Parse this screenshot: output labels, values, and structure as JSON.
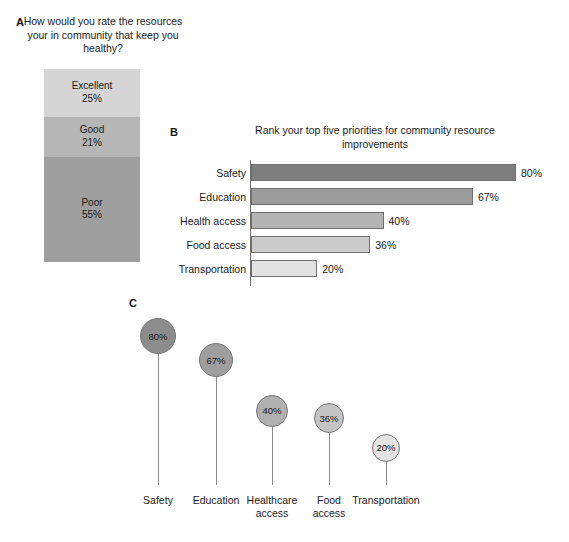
{
  "figure": {
    "width": 569,
    "height": 542,
    "background": "#ffffff"
  },
  "panel_a": {
    "letter": "A",
    "title": "How would you rate the resources your in community that keep you healthy?",
    "chart_data": {
      "type": "bar",
      "subtype": "stacked-100",
      "title": "How would you rate the resources your in community that keep you healthy?",
      "xlabel": "",
      "ylabel": "",
      "ylim": [
        0,
        100
      ],
      "grid": false,
      "legend": "none",
      "categories": [
        "Excellent",
        "Good",
        "Poor"
      ],
      "values": [
        25,
        21,
        55
      ],
      "value_labels": [
        "25%",
        "21%",
        "55%"
      ],
      "colors": [
        "#d5d5d5",
        "#b6b6b6",
        "#9e9e9e"
      ],
      "segments": [
        {
          "label": "Excellent",
          "value": 25,
          "value_label": "25%",
          "color": "#d5d5d5"
        },
        {
          "label": "Good",
          "value": 21,
          "value_label": "21%",
          "color": "#b6b6b6"
        },
        {
          "label": "Poor",
          "value": 55,
          "value_label": "55%",
          "color": "#9e9e9e"
        }
      ]
    }
  },
  "panel_b": {
    "letter": "B",
    "title": "Rank your top five priorities for community resource improvements",
    "chart_data": {
      "type": "bar",
      "subtype": "horizontal",
      "title": "Rank your top five priorities for community resource improvements",
      "xlabel": "",
      "ylabel": "",
      "xlim": [
        0,
        88
      ],
      "grid": false,
      "legend": "none",
      "categories": [
        "Safety",
        "Education",
        "Health access",
        "Food access",
        "Transportation"
      ],
      "values": [
        80,
        67,
        40,
        36,
        20
      ],
      "value_labels": [
        "80%",
        "67%",
        "40%",
        "36%",
        "20%"
      ],
      "colors": [
        "#7e7e7e",
        "#9c9c9c",
        "#b3b3b3",
        "#cbcbcb",
        "#e2e2e2"
      ],
      "bars": [
        {
          "label": "Safety",
          "value": 80,
          "value_label": "80%",
          "color": "#7e7e7e"
        },
        {
          "label": "Education",
          "value": 67,
          "value_label": "67%",
          "color": "#9c9c9c"
        },
        {
          "label": "Health access",
          "value": 40,
          "value_label": "40%",
          "color": "#b3b3b3"
        },
        {
          "label": "Food access",
          "value": 36,
          "value_label": "36%",
          "color": "#cbcbcb"
        },
        {
          "label": "Transportation",
          "value": 20,
          "value_label": "20%",
          "color": "#e2e2e2"
        }
      ]
    }
  },
  "panel_c": {
    "letter": "C",
    "title": "",
    "chart_data": {
      "type": "scatter",
      "subtype": "lollipop",
      "title": "",
      "xlabel": "",
      "ylabel": "",
      "ylim": [
        0,
        88
      ],
      "grid": false,
      "legend": "none",
      "categories": [
        "Safety",
        "Education",
        "Healthcare access",
        "Food access",
        "Transportation"
      ],
      "values": [
        80,
        67,
        40,
        36,
        20
      ],
      "value_labels": [
        "80%",
        "67%",
        "40%",
        "36%",
        "20%"
      ],
      "colors": [
        "#8c8c8c",
        "#9e9e9e",
        "#b0b0b0",
        "#c4c4c4",
        "#e4e4e4"
      ],
      "points": [
        {
          "label": "Safety",
          "label_line1": "Safety",
          "label_line2": "",
          "value": 80,
          "value_label": "80%",
          "color": "#8c8c8c",
          "radius": 18
        },
        {
          "label": "Education",
          "label_line1": "Education",
          "label_line2": "",
          "value": 67,
          "value_label": "67%",
          "color": "#9e9e9e",
          "radius": 17
        },
        {
          "label": "Healthcare access",
          "label_line1": "Healthcare",
          "label_line2": "access",
          "value": 40,
          "value_label": "40%",
          "color": "#b0b0b0",
          "radius": 16
        },
        {
          "label": "Food access",
          "label_line1": "Food",
          "label_line2": "access",
          "value": 36,
          "value_label": "36%",
          "color": "#c4c4c4",
          "radius": 15
        },
        {
          "label": "Transportation",
          "label_line1": "Transportation",
          "label_line2": "",
          "value": 20,
          "value_label": "20%",
          "color": "#e4e4e4",
          "radius": 14
        }
      ]
    }
  }
}
